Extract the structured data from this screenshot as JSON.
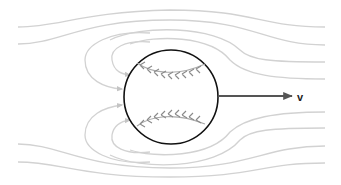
{
  "figure": {
    "velocity_label": "v",
    "colors": {
      "streamline": "#cfcfcf",
      "ball_outline": "#111111",
      "stitch": "#888888",
      "arrow": "#555555",
      "background": "#ffffff"
    }
  }
}
